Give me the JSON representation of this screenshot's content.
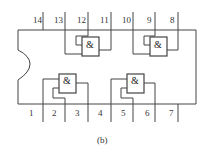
{
  "figure": {
    "caption": "(b)",
    "top_pins": [
      "14",
      "13",
      "12",
      "11",
      "10",
      "9",
      "8"
    ],
    "bottom_pins": [
      "1",
      "2",
      "3",
      "4",
      "5",
      "6",
      "7"
    ],
    "gates": [
      {
        "id": "gate-upper-left",
        "symbol": "&"
      },
      {
        "id": "gate-upper-right",
        "symbol": "&"
      },
      {
        "id": "gate-lower-left",
        "symbol": "&"
      },
      {
        "id": "gate-lower-right",
        "symbol": "&"
      }
    ]
  }
}
